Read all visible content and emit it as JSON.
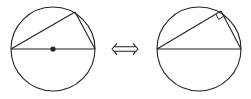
{
  "diagram": {
    "description": "Thales' theorem equivalence: a triangle inscribed in a circle with one side as diameter (center marked) is equivalent to the triangle having a right angle at the point on the circle.",
    "stroke_color": "#222222",
    "background": "#ffffff",
    "left_figure": {
      "label": "Triangle on diameter with center dot",
      "circle": {
        "cx": 53,
        "cy": 49,
        "r": 42
      },
      "diameter": {
        "x1": 11,
        "y1": 49,
        "x2": 95,
        "y2": 49
      },
      "apex": {
        "x": 75,
        "y": 12
      },
      "center_dot": {
        "cx": 53,
        "cy": 49,
        "r": 2.6
      }
    },
    "equivalence_symbol": {
      "glyph": "⇔",
      "x": 125,
      "y": 49
    },
    "right_figure": {
      "label": "Triangle with right angle marker",
      "circle": {
        "cx": 199,
        "cy": 49,
        "r": 42
      },
      "diameter": {
        "x1": 157,
        "y1": 49,
        "x2": 241,
        "y2": 49
      },
      "apex": {
        "x": 221,
        "y": 11
      },
      "right_angle_size": 6
    }
  }
}
